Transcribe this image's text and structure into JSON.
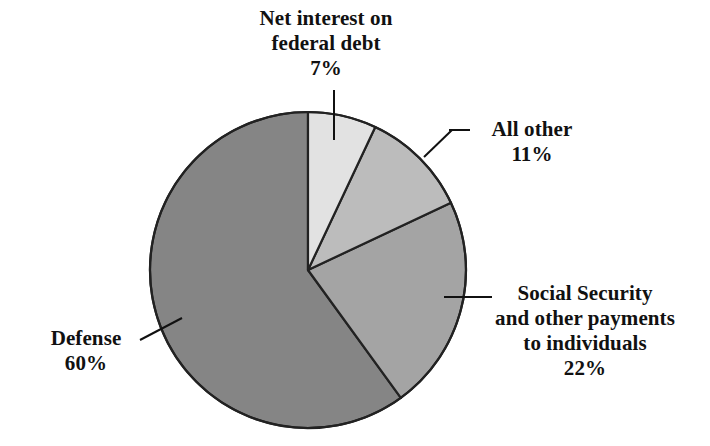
{
  "chart_data": {
    "type": "pie",
    "title": "",
    "subtitle": "",
    "xlabel": "",
    "ylabel": "",
    "legend_position": "none",
    "grid": false,
    "units": "percent",
    "start_angle_deg": 0,
    "direction": "clockwise",
    "categories": [
      "Net interest on federal debt",
      "All other",
      "Social Security and other payments to individuals",
      "Defense"
    ],
    "values": [
      7,
      11,
      22,
      60
    ],
    "value_labels": [
      "7%",
      "11%",
      "22%",
      "60%"
    ],
    "colors": [
      "#e2e2e2",
      "#bcbcbc",
      "#a4a4a4",
      "#858585"
    ],
    "slices": [
      {
        "name": "Net interest on federal debt",
        "value": 7,
        "value_label": "7%",
        "color": "#e2e2e2",
        "start_deg": 0,
        "end_deg": 25.2,
        "label_lines": [
          "Net interest on",
          "federal debt"
        ],
        "leader": "vertical"
      },
      {
        "name": "All other",
        "value": 11,
        "value_label": "11%",
        "color": "#bcbcbc",
        "start_deg": 25.2,
        "end_deg": 64.8,
        "label_lines": [
          "All other"
        ],
        "leader": "diagonal"
      },
      {
        "name": "Social Security and other payments to individuals",
        "value": 22,
        "value_label": "22%",
        "color": "#a4a4a4",
        "start_deg": 64.8,
        "end_deg": 144.0,
        "label_lines": [
          "Social Security",
          "and other payments",
          "to individuals"
        ],
        "leader": "horizontal"
      },
      {
        "name": "Defense",
        "value": 60,
        "value_label": "60%",
        "color": "#858585",
        "start_deg": 144.0,
        "end_deg": 360.0,
        "label_lines": [
          "Defense"
        ],
        "leader": "diagonal"
      }
    ],
    "outline_color": "#222222"
  },
  "labels": {
    "net_interest": {
      "line1": "Net interest on",
      "line2": "federal debt",
      "pct": "7%"
    },
    "all_other": {
      "line1": "All other",
      "pct": "11%"
    },
    "social_security": {
      "line1": "Social Security",
      "line2": "and other payments",
      "line3": "to individuals",
      "pct": "22%"
    },
    "defense": {
      "line1": "Defense",
      "pct": "60%"
    }
  }
}
